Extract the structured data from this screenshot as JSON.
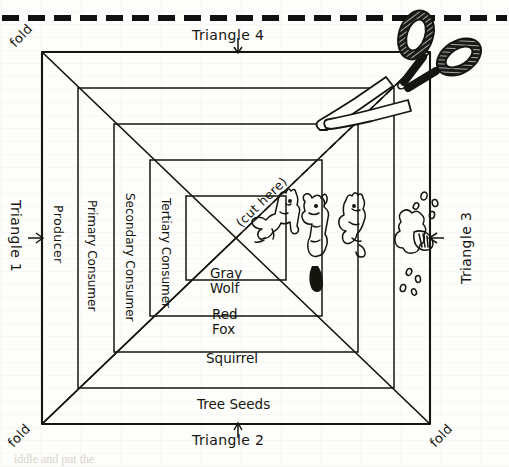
{
  "worksheet": {
    "title": "Energy Pyramid Foldable Template",
    "cut_line_label": "(cut here)",
    "corner_folds": [
      {
        "id": "fold-top-left",
        "label": "fold"
      },
      {
        "id": "fold-bottom-left",
        "label": "fold"
      },
      {
        "id": "fold-bottom-right",
        "label": "fold"
      }
    ],
    "triangles": [
      {
        "id": "triangle-1",
        "label": "Triangle 1",
        "side": "left"
      },
      {
        "id": "triangle-2",
        "label": "Triangle 2",
        "side": "bottom"
      },
      {
        "id": "triangle-3",
        "label": "Triangle 3",
        "side": "right"
      },
      {
        "id": "triangle-4",
        "label": "Triangle 4",
        "side": "top"
      }
    ],
    "trophic_levels": [
      {
        "id": "producer",
        "label": "Producer"
      },
      {
        "id": "primary-consumer",
        "label": "Primary\nConsumer"
      },
      {
        "id": "secondary-consumer",
        "label": "Secondary\nConsumer"
      },
      {
        "id": "tertiary-consumer",
        "label": "Tertiary\nConsumer"
      }
    ],
    "trophic_labels_flat": [
      "Producer",
      "Primary Consumer",
      "Secondary Consumer",
      "Tertiary Consumer"
    ],
    "organisms": [
      {
        "id": "gray-wolf",
        "label": "Gray\nWolf",
        "line1": "Gray",
        "line2": "Wolf"
      },
      {
        "id": "red-fox",
        "label": "Red\nFox",
        "line1": "Red",
        "line2": "Fox"
      },
      {
        "id": "squirrel",
        "label": "Squirrel",
        "line1": "Squirrel",
        "line2": ""
      },
      {
        "id": "tree-seeds",
        "label": "Tree Seeds",
        "line1": "Tree Seeds",
        "line2": ""
      }
    ],
    "drawings": [
      {
        "id": "wolf-drawing",
        "name": "gray-wolf-sketch"
      },
      {
        "id": "fox-drawing",
        "name": "red-fox-sketch"
      },
      {
        "id": "squirrel-drawing",
        "name": "squirrel-sketch"
      },
      {
        "id": "tree-drawing",
        "name": "tree-with-seeds-sketch"
      }
    ],
    "tool": {
      "id": "scissors",
      "name": "scissors-icon"
    },
    "colors": {
      "ink": "#15150f",
      "paper": "#fdfdfb",
      "dash": "#111111"
    }
  },
  "ghost_text": {
    "lines": [
      "the three points of the triangle",
      "and the tip of the"
    ],
    "bottom_caption": "iddle and put the"
  }
}
